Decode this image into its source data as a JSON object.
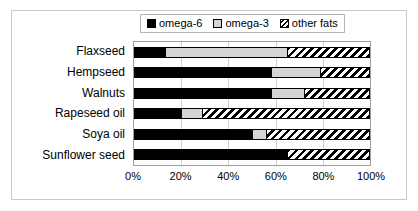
{
  "chart_data": {
    "type": "bar",
    "orientation": "horizontal",
    "stacked": true,
    "normalized_percent": true,
    "title": "",
    "subtitle": "",
    "xlabel": "",
    "ylabel": "",
    "xlim": [
      0,
      100
    ],
    "xtick_labels": [
      "0%",
      "20%",
      "40%",
      "60%",
      "80%",
      "100%"
    ],
    "xtick_values": [
      0,
      20,
      40,
      60,
      80,
      100
    ],
    "grid": "vertical",
    "legend_position": "top",
    "categories": [
      "Flaxseed",
      "Hempseed",
      "Walnuts",
      "Rapeseed oil",
      "Soya oil",
      "Sunflower seed"
    ],
    "series": [
      {
        "name": "omega-6",
        "fill": "solid-black",
        "color": "#000000",
        "values": [
          13,
          58,
          58,
          20,
          50,
          65
        ]
      },
      {
        "name": "omega-3",
        "fill": "solid-light-gray",
        "color": "#d4d4d4",
        "values": [
          52,
          21,
          14,
          9,
          6,
          0
        ]
      },
      {
        "name": "other fats",
        "fill": "diagonal-hatch",
        "color": "#ffffff",
        "values": [
          35,
          21,
          28,
          71,
          44,
          35
        ]
      }
    ],
    "cumulative_boundaries": {
      "Flaxseed": [
        13,
        65,
        100
      ],
      "Hempseed": [
        58,
        79,
        100
      ],
      "Walnuts": [
        58,
        72,
        100
      ],
      "Rapeseed oil": [
        20,
        29,
        100
      ],
      "Soya oil": [
        50,
        56,
        100
      ],
      "Sunflower seed": [
        65,
        65,
        100
      ]
    }
  },
  "legend": {
    "items": [
      {
        "label": "omega-6",
        "swatch": "solid-black-swatch"
      },
      {
        "label": "omega-3",
        "swatch": "light-gray-swatch"
      },
      {
        "label": "other fats",
        "swatch": "hatched-swatch"
      }
    ]
  },
  "colors": {
    "omega6": "#000000",
    "omega3": "#d4d4d4",
    "other_fats": "#ffffff",
    "gridline": "#d0d0d0",
    "plot_border": "#9e9e9e",
    "frame_border": "#c9c9c9",
    "background": "#ffffff"
  }
}
